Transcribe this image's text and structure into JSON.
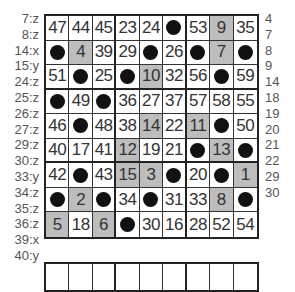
{
  "left_labels": [
    "7:z",
    "8:z",
    "14:x",
    "15:y",
    "24:z",
    "25:z",
    "26:z",
    "27:z",
    "29:z",
    "30:z",
    "33:y",
    "34:z",
    "35:z",
    "36:z",
    "39:x",
    "40:y"
  ],
  "right_labels": [
    "4",
    "7",
    "8",
    "9",
    "14",
    "18",
    "19",
    "20",
    "21",
    "22",
    "29",
    "30"
  ],
  "grid": {
    "rows": [
      [
        {
          "v": "47"
        },
        {
          "v": "44"
        },
        {
          "v": "45"
        },
        {
          "v": "23"
        },
        {
          "v": "24"
        },
        {
          "dot": true
        },
        {
          "v": "53"
        },
        {
          "v": "9",
          "shaded": true
        },
        {
          "v": "35"
        }
      ],
      [
        {
          "dot": true
        },
        {
          "v": "4",
          "shaded": true
        },
        {
          "v": "39"
        },
        {
          "v": "29"
        },
        {
          "dot": true
        },
        {
          "v": "26"
        },
        {
          "dot": true
        },
        {
          "v": "7",
          "shaded": true
        },
        {
          "dot": true
        }
      ],
      [
        {
          "v": "51"
        },
        {
          "dot": true
        },
        {
          "v": "25"
        },
        {
          "dot": true
        },
        {
          "v": "10",
          "shaded": true
        },
        {
          "v": "32"
        },
        {
          "v": "56"
        },
        {
          "dot": true
        },
        {
          "v": "59"
        }
      ],
      [
        {
          "dot": true
        },
        {
          "v": "49"
        },
        {
          "dot": true
        },
        {
          "v": "36"
        },
        {
          "v": "27"
        },
        {
          "v": "37"
        },
        {
          "v": "57"
        },
        {
          "v": "58"
        },
        {
          "v": "55"
        }
      ],
      [
        {
          "v": "46"
        },
        {
          "dot": true
        },
        {
          "v": "48"
        },
        {
          "v": "38"
        },
        {
          "v": "14",
          "shaded": true
        },
        {
          "v": "22"
        },
        {
          "v": "11",
          "shaded": true
        },
        {
          "dot": true
        },
        {
          "v": "50"
        }
      ],
      [
        {
          "v": "40"
        },
        {
          "v": "17"
        },
        {
          "v": "41"
        },
        {
          "v": "12",
          "shaded": true
        },
        {
          "v": "19"
        },
        {
          "v": "21"
        },
        {
          "dot": true
        },
        {
          "v": "13",
          "shaded": true
        },
        {
          "dot": true
        }
      ],
      [
        {
          "v": "42"
        },
        {
          "dot": true
        },
        {
          "v": "43"
        },
        {
          "v": "15",
          "shaded": true
        },
        {
          "v": "3",
          "shaded": true
        },
        {
          "dot": true
        },
        {
          "v": "20"
        },
        {
          "dot": true
        },
        {
          "v": "1",
          "shaded": true
        }
      ],
      [
        {
          "dot": true
        },
        {
          "v": "2",
          "shaded": true
        },
        {
          "dot": true
        },
        {
          "v": "34"
        },
        {
          "dot": true
        },
        {
          "v": "31"
        },
        {
          "v": "33"
        },
        {
          "v": "8",
          "shaded": true
        },
        {
          "dot": true
        }
      ],
      [
        {
          "v": "5",
          "shaded": true
        },
        {
          "v": "18"
        },
        {
          "v": "6",
          "shaded": true
        },
        {
          "dot": true
        },
        {
          "v": "30"
        },
        {
          "v": "16"
        },
        {
          "v": "28"
        },
        {
          "v": "52"
        },
        {
          "v": "54"
        }
      ]
    ]
  },
  "colors": {
    "shade": "#bdbdbd",
    "border": "#222222",
    "text": "#333333",
    "dot": "#111111"
  }
}
